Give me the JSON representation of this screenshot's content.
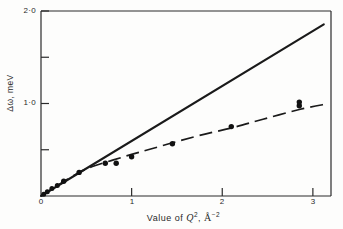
{
  "figure": {
    "background_color": "#fdfdfc",
    "ink_color": "#1a1a1a"
  },
  "axes": {
    "x_title_prefix": "Value of ",
    "x_title_symbol": "Q",
    "x_title_symbol_exp": "2",
    "x_title_sep": ", ",
    "x_title_unit": "Å",
    "x_title_unit_exp": "−2",
    "y_title": "Δω, meV",
    "x_ticks": [
      "0",
      "1",
      "2",
      "3"
    ],
    "y_ticks": [
      "1·0",
      "2·0"
    ]
  },
  "chart_data": {
    "type": "line",
    "title": "",
    "xlabel": "Value of Q², Å⁻²",
    "ylabel": "Δω, meV",
    "xlim": [
      0,
      3.2
    ],
    "ylim": [
      0,
      2.0
    ],
    "xticks": [
      0,
      1,
      2,
      3
    ],
    "yticks": [
      0.5,
      1.0,
      1.5,
      2.0
    ],
    "ytick_labels": [
      "",
      "1·0",
      "",
      "2·0"
    ],
    "grid": false,
    "legend": "none",
    "series": [
      {
        "name": "Free-particle recoil line",
        "style": "solid",
        "type": "line",
        "x": [
          0.0,
          3.12
        ],
        "y": [
          0.0,
          1.855
        ]
      },
      {
        "name": "Fitted curve through data",
        "style": "dashed",
        "type": "line",
        "x": [
          0.0,
          0.2,
          0.42,
          0.6,
          0.8,
          1.0,
          1.2,
          1.45,
          1.75,
          2.1,
          2.45,
          2.85,
          3.15
        ],
        "y": [
          0.0,
          0.125,
          0.255,
          0.33,
          0.39,
          0.45,
          0.505,
          0.575,
          0.655,
          0.735,
          0.83,
          0.935,
          0.995
        ]
      },
      {
        "name": "Measured data points",
        "style": "marker",
        "type": "scatter",
        "points": [
          {
            "x": 0.03,
            "y": 0.02
          },
          {
            "x": 0.07,
            "y": 0.045
          },
          {
            "x": 0.12,
            "y": 0.08
          },
          {
            "x": 0.18,
            "y": 0.115
          },
          {
            "x": 0.25,
            "y": 0.16
          },
          {
            "x": 0.42,
            "y": 0.255
          },
          {
            "x": 0.71,
            "y": 0.355
          },
          {
            "x": 0.83,
            "y": 0.355
          },
          {
            "x": 1.0,
            "y": 0.425
          },
          {
            "x": 1.45,
            "y": 0.565
          },
          {
            "x": 2.1,
            "y": 0.75
          },
          {
            "x": 2.85,
            "y": 0.975
          },
          {
            "x": 2.85,
            "y": 1.015
          }
        ]
      }
    ]
  }
}
